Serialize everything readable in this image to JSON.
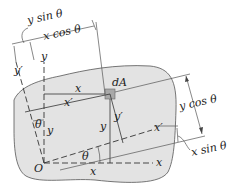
{
  "diagram": {
    "type": "rotated-axes-area-element",
    "colors": {
      "region_fill": "#e3e3e3",
      "region_stroke": "#555555",
      "element_fill": "#a8a8a8",
      "line": "#333333"
    },
    "labels": {
      "origin": "O",
      "x_axis": "x",
      "y_axis": "y",
      "x_prime_axis": "x′",
      "y_prime_axis": "y′",
      "area_element": "dA",
      "x_coord": "x",
      "y_coord": "y",
      "x_prime_coord": "x′",
      "y_prime_coord": "y′",
      "theta_bottom": "θ",
      "theta_left": "θ",
      "y_sin_theta": "y sin θ",
      "x_cos_theta": "x cos θ",
      "y_cos_theta": "y cos θ",
      "x_sin_theta": "x sin θ"
    }
  }
}
